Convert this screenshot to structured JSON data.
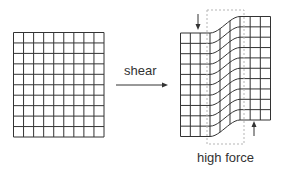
{
  "diagram": {
    "arrow_label": "shear",
    "force_label": "high force",
    "colors": {
      "grid_line": "#333333",
      "dashed_outline": "#b5b5b5",
      "text": "#333333"
    },
    "original_grid": {
      "columns": 9,
      "rows": 10
    },
    "sheared_grid": {
      "columns": 9,
      "rows": 10,
      "left_block_columns": 3,
      "shear_columns": 3,
      "right_block_columns": 3
    }
  }
}
